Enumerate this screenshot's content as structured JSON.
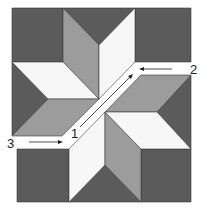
{
  "diagram": {
    "colors": {
      "dark": "#5b5b5b",
      "medium": "#9c9c9c",
      "light": "#f7f7f7",
      "outline": "#3a3a3a",
      "arrow": "#222222",
      "background": "#ffffff"
    },
    "steps": [
      {
        "label": "1",
        "description": "Sew along diagonal seam"
      },
      {
        "label": "2",
        "description": "Sew upper-right inset seam"
      },
      {
        "label": "3",
        "description": "Sew lower-left inset seam"
      }
    ]
  }
}
